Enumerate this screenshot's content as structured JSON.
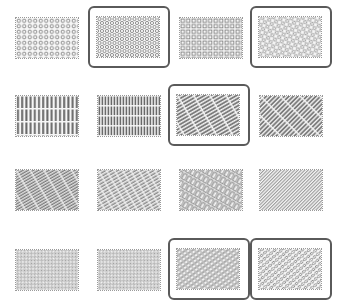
{
  "panel": {
    "title": "",
    "colors": {
      "frame": "#5a5a5a",
      "pattern": "#7a7a7a",
      "background": "#ffffff"
    }
  },
  "tiles": [
    {
      "id": "r1c1",
      "row": 1,
      "col": 1,
      "pattern": "circles-grid",
      "selected": false,
      "x": 6,
      "y": 8
    },
    {
      "id": "r1c2",
      "row": 1,
      "col": 2,
      "pattern": "circles-staggered",
      "selected": true,
      "x": 88,
      "y": 6
    },
    {
      "id": "r1c3",
      "row": 1,
      "col": 3,
      "pattern": "squares-grid",
      "selected": false,
      "x": 170,
      "y": 8
    },
    {
      "id": "r1c4",
      "row": 1,
      "col": 4,
      "pattern": "circles-diagonal",
      "selected": true,
      "x": 250,
      "y": 6
    },
    {
      "id": "r2c1",
      "row": 2,
      "col": 1,
      "pattern": "vertical-slots",
      "selected": false,
      "x": 6,
      "y": 86
    },
    {
      "id": "r2c2",
      "row": 2,
      "col": 2,
      "pattern": "vertical-slots-dense",
      "selected": false,
      "x": 88,
      "y": 86
    },
    {
      "id": "r2c3",
      "row": 2,
      "col": 3,
      "pattern": "diagonal-slots",
      "selected": true,
      "x": 168,
      "y": 84
    },
    {
      "id": "r2c4",
      "row": 2,
      "col": 4,
      "pattern": "diagonal-slots-steep",
      "selected": false,
      "x": 250,
      "y": 86
    },
    {
      "id": "r3c1",
      "row": 3,
      "col": 1,
      "pattern": "diagonal-dashes",
      "selected": false,
      "x": 6,
      "y": 160
    },
    {
      "id": "r3c2",
      "row": 3,
      "col": 2,
      "pattern": "diagonal-dashes-fine",
      "selected": false,
      "x": 88,
      "y": 160
    },
    {
      "id": "r3c3",
      "row": 3,
      "col": 3,
      "pattern": "diagonal-rects",
      "selected": false,
      "x": 170,
      "y": 160
    },
    {
      "id": "r3c4",
      "row": 3,
      "col": 4,
      "pattern": "diagonal-fine",
      "selected": false,
      "x": 250,
      "y": 160
    },
    {
      "id": "r4c1",
      "row": 4,
      "col": 1,
      "pattern": "micro-dots",
      "selected": false,
      "x": 6,
      "y": 240
    },
    {
      "id": "r4c2",
      "row": 4,
      "col": 2,
      "pattern": "micro-dots",
      "selected": false,
      "x": 88,
      "y": 240
    },
    {
      "id": "r4c3",
      "row": 4,
      "col": 3,
      "pattern": "diagonal-ovals",
      "selected": true,
      "x": 168,
      "y": 238
    },
    {
      "id": "r4c4",
      "row": 4,
      "col": 4,
      "pattern": "diagonal-ovals-irregular",
      "selected": true,
      "x": 250,
      "y": 238
    }
  ]
}
